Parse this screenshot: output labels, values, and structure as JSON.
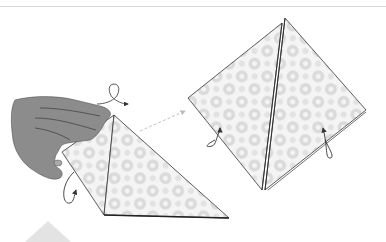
{
  "figure": {
    "type": "origami-instruction",
    "steps": [
      {
        "id": "left",
        "description": "Hand holding folded triangle, turn-over symbol above"
      },
      {
        "id": "right",
        "description": "Resulting diamond/square base with rotation arrows"
      }
    ],
    "symbols": [
      "turn-over-loop-arrow",
      "dashed-transition-arrow",
      "rotation-arrow-left",
      "rotation-arrow-right",
      "rotation-arrow-left-step2"
    ],
    "colors": {
      "outline": "#333333",
      "pattern": "#d9d9d9",
      "hand": "#8c8c8c",
      "rule": "#d8d8d8",
      "marker": "#e3e3e3"
    }
  }
}
